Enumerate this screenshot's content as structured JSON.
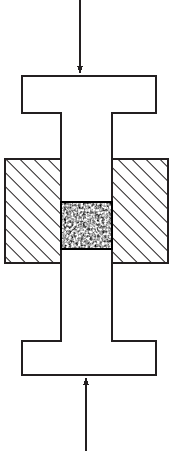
{
  "figure": {
    "type": "technical-diagram",
    "background_color": "#ffffff",
    "line_color": "#231f20",
    "canvas": {
      "width": 173,
      "height": 451
    }
  },
  "specimen": {
    "name": "I-shaped specimen",
    "outline_color": "#231f20",
    "fill_color": "#ffffff",
    "stroke_width": 1.4,
    "top_flange": {
      "x": 22,
      "y": 76,
      "width": 134,
      "height": 37
    },
    "web": {
      "x": 61,
      "y": 113,
      "width": 51,
      "height": 228
    },
    "bottom_flange": {
      "x": 22,
      "y": 341,
      "width": 134,
      "height": 34
    }
  },
  "platens": {
    "name": "hatched fixture blocks",
    "hatch_angle_deg": 45,
    "hatch_spacing": 7,
    "hatch_color": "#231f20",
    "border_color": "#231f20",
    "fill_color": "#ffffff",
    "left": {
      "x": 5,
      "y": 159,
      "width": 56,
      "height": 104
    },
    "right": {
      "x": 112,
      "y": 159,
      "width": 56,
      "height": 104
    }
  },
  "core": {
    "name": "granular speckled core",
    "x": 61,
    "y": 202,
    "width": 51,
    "height": 47,
    "speckle_dark": "#1a1a1a",
    "speckle_light": "#ffffff",
    "border_color": "#000000"
  },
  "arrows": {
    "top": {
      "label": "applied load arrow, downward",
      "direction": "down",
      "x": 80,
      "y_start": 0,
      "y_end": 74,
      "color": "#231f20",
      "shaft_width": 1.2,
      "head_width": 6,
      "head_height": 8
    },
    "bottom": {
      "label": "reaction load arrow, upward",
      "direction": "up",
      "x": 86,
      "y_start": 451,
      "y_end": 377,
      "color": "#231f20",
      "shaft_width": 1.2,
      "head_width": 6,
      "head_height": 8
    }
  }
}
